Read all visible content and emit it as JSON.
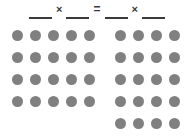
{
  "worksheet": {
    "title": "Commutative property multiplication array worksheet",
    "background_color": "#ffffff"
  },
  "equation": {
    "blank_value": "",
    "blank_placeholder": "",
    "blank_1": "",
    "blank_2": "",
    "blank_3": "",
    "blank_4": "",
    "multiply_symbol": "×",
    "equals_symbol": "=",
    "text": "__ × __ = __ × __",
    "line_color": "#3a3a3a",
    "symbol_color": "#3a3a3a"
  },
  "arrays": {
    "dot_color": "#808080",
    "left": {
      "name": "left-array",
      "columns": 5,
      "rows": 4,
      "total": 20,
      "rows_data": [
        [
          1,
          1,
          1,
          1,
          1
        ],
        [
          1,
          1,
          1,
          1,
          1
        ],
        [
          1,
          1,
          1,
          1,
          1
        ],
        [
          1,
          1,
          1,
          1,
          1
        ]
      ]
    },
    "right": {
      "name": "right-array",
      "columns": 4,
      "rows": 5,
      "total": 20,
      "rows_data": [
        [
          1,
          1,
          1,
          1
        ],
        [
          1,
          1,
          1,
          1
        ],
        [
          1,
          1,
          1,
          1
        ],
        [
          1,
          1,
          1,
          1
        ],
        [
          1,
          1,
          1,
          1
        ]
      ]
    }
  }
}
